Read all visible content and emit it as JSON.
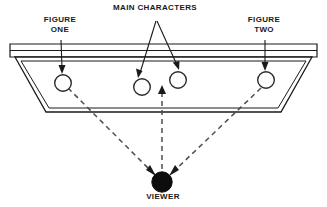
{
  "diagram": {
    "title_labels": {
      "main_characters": "MAIN CHARACTERS",
      "figure_one": "FIGURE\nONE",
      "figure_two": "FIGURE\nTWO",
      "viewer": "VIEWER"
    },
    "colors": {
      "line": "#1a1a1a",
      "fill": "#ffffff",
      "viewer_fill": "#0d0d0d",
      "text": "#1a1a1a",
      "dashed": "#555555"
    },
    "figures": [
      {
        "name": "figure-one",
        "cx": 63,
        "cy": 82,
        "r": 8.5
      },
      {
        "name": "main-character-left",
        "cx": 142,
        "cy": 86,
        "r": 8.5
      },
      {
        "name": "main-character-right",
        "cx": 178,
        "cy": 80,
        "r": 8.5
      },
      {
        "name": "figure-two",
        "cx": 266,
        "cy": 80,
        "r": 8.5
      }
    ],
    "viewer_point": {
      "cx": 162,
      "cy": 182,
      "r": 10.5
    },
    "sightlines": [
      {
        "name": "sightline-left",
        "from": [
          68,
          88
        ],
        "to": [
          153,
          176
        ]
      },
      {
        "name": "sightline-center",
        "from": [
          162,
          89
        ],
        "to": [
          162,
          168
        ]
      },
      {
        "name": "sightline-right",
        "from": [
          262,
          88
        ],
        "to": [
          172,
          176
        ]
      }
    ],
    "leader_arrows": [
      {
        "name": "leader-figure-one",
        "from": [
          60,
          40
        ],
        "to": [
          62,
          71
        ]
      },
      {
        "name": "leader-main-left",
        "from": [
          155,
          22
        ],
        "to": [
          139,
          74
        ]
      },
      {
        "name": "leader-main-right",
        "from": [
          155,
          22
        ],
        "to": [
          177,
          68
        ]
      },
      {
        "name": "leader-figure-two",
        "from": [
          265,
          40
        ],
        "to": [
          265,
          69
        ]
      }
    ]
  }
}
